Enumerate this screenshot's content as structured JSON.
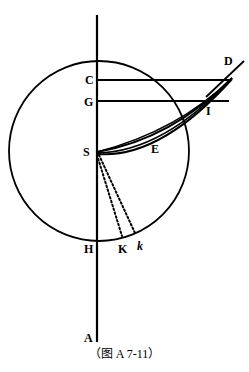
{
  "figure": {
    "caption": "（图 A 7-11）",
    "background_color": "#ffffff",
    "stroke_color": "#000000",
    "labels": [
      {
        "id": "D",
        "text": "D",
        "x": 224,
        "y": 55,
        "italic": false
      },
      {
        "id": "C",
        "text": "C",
        "x": 85,
        "y": 74,
        "italic": false
      },
      {
        "id": "G",
        "text": "G",
        "x": 84,
        "y": 96,
        "italic": false
      },
      {
        "id": "I",
        "text": "I",
        "x": 206,
        "y": 105,
        "italic": false
      },
      {
        "id": "S",
        "text": "S",
        "x": 83,
        "y": 146,
        "italic": false
      },
      {
        "id": "E",
        "text": "E",
        "x": 151,
        "y": 143,
        "italic": false
      },
      {
        "id": "H",
        "text": "H",
        "x": 84,
        "y": 243,
        "italic": false
      },
      {
        "id": "K",
        "text": "K",
        "x": 118,
        "y": 243,
        "italic": false
      },
      {
        "id": "k",
        "text": "k",
        "x": 137,
        "y": 240,
        "italic": true
      },
      {
        "id": "A",
        "text": "A",
        "x": 84,
        "y": 332,
        "italic": false
      }
    ],
    "geometry": {
      "circle": {
        "cx": 99,
        "cy": 151,
        "r": 90
      },
      "vertical_axis": {
        "x1": 97,
        "y1": 15,
        "x2": 97,
        "y2": 342
      },
      "point_S": {
        "x": 97,
        "y": 152
      },
      "point_D": {
        "x": 232,
        "y": 78
      },
      "line_CD": {
        "x1": 97,
        "y1": 80,
        "x2": 231,
        "y2": 80
      },
      "line_GI": {
        "x1": 97,
        "y1": 101,
        "x2": 228,
        "y2": 101
      },
      "ray_through_D": {
        "x1": 205,
        "y1": 96,
        "x2": 243,
        "y2": 62
      },
      "dotted_SK": {
        "x1": 97,
        "y1": 154,
        "x2": 122,
        "y2": 236
      },
      "dotted_Sk": {
        "x1": 98,
        "y1": 154,
        "x2": 135,
        "y2": 233
      }
    }
  }
}
